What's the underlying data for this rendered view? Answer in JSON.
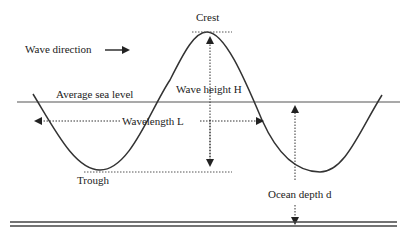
{
  "diagram": {
    "labels": {
      "crest": "Crest",
      "wave_direction": "Wave direction",
      "average_sea_level": "Average sea level",
      "wave_height": "Wave height H",
      "wavelength": "Wavelength L",
      "trough": "Trough",
      "ocean_depth": "Ocean depth d"
    },
    "colors": {
      "ink": "#222222",
      "line": "#555555"
    }
  }
}
